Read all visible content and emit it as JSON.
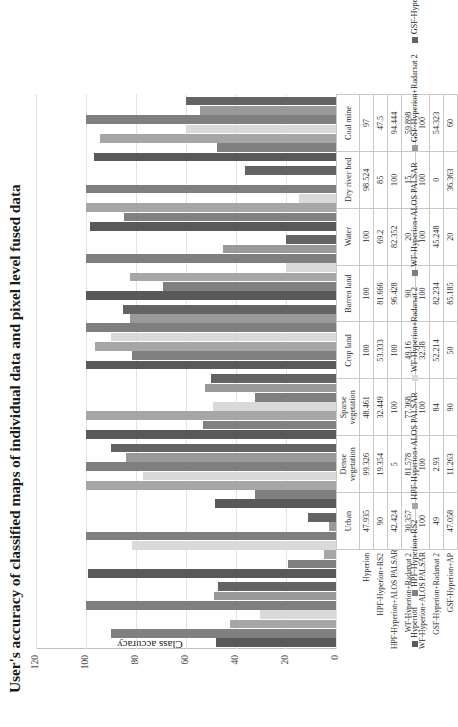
{
  "chart_data": {
    "type": "bar",
    "title": "User's accuracy of classified maps of individual data and pixel level fused data",
    "xlabel": "",
    "ylabel": "Class accuracy",
    "ylim": [
      0,
      120
    ],
    "yticks": [
      120,
      100,
      80,
      60,
      40,
      20,
      0
    ],
    "grid": true,
    "legend_position": "bottom",
    "categories": [
      "Urban",
      "Dense vegetation",
      "Sparse vegetation",
      "Crop land",
      "Barren land",
      "Water",
      "Dry river bed",
      "Coal mine"
    ],
    "series": [
      {
        "name": "Hyperion",
        "color": "#595959",
        "values": [
          47.935,
          99.326,
          48.461,
          100,
          100,
          100,
          98.524,
          97
        ]
      },
      {
        "name": "HPF-Hyperion+RS2",
        "color": "#808080",
        "values": [
          90,
          19.354,
          32.449,
          53.333,
          81.666,
          69.2,
          85,
          47.5
        ]
      },
      {
        "name": "HPF-Hyperion+ALOS PALSAR",
        "color": "#a6a6a6",
        "values": [
          42.424,
          5,
          100,
          100,
          96.428,
          82.352,
          100,
          94.444
        ]
      },
      {
        "name": "WF-Hyperion+Radarsat 2",
        "color": "#d9d9d9",
        "values": [
          30.357,
          81.578,
          77.368,
          49.16,
          90,
          20,
          15,
          59.898
        ]
      },
      {
        "name": "WF-Hyperion+ALOS PALSAR",
        "color": "#7f7f7f",
        "values": [
          100,
          100,
          100,
          32.38,
          100,
          100,
          100,
          100
        ]
      },
      {
        "name": "GSF-Hyperion+Radarsat 2",
        "color": "#999999",
        "values": [
          49,
          2.93,
          84,
          52.214,
          82.234,
          45.248,
          0,
          54.323
        ]
      },
      {
        "name": "GSF-Hyperion+AP",
        "color": "#636363",
        "values": [
          47.058,
          11.263,
          90,
          50,
          85.185,
          20,
          36.363,
          60
        ]
      }
    ]
  },
  "table": {
    "column_headers": [
      "Urban",
      "Dense vegetation",
      "Sparse vegetation",
      "Crop land",
      "Barren land",
      "Water",
      "Dry river bed",
      "Coal mine"
    ],
    "rows": [
      {
        "label": "Hyperion",
        "values": [
          "47.935",
          "99.326",
          "48.461",
          "100",
          "100",
          "100",
          "98.524",
          "97"
        ]
      },
      {
        "label": "HPF-Hyperion+RS2",
        "values": [
          "90",
          "19.354",
          "32.449",
          "53.333",
          "81.666",
          "69.2",
          "85",
          "47.5"
        ]
      },
      {
        "label": "HPF-Hyperion+ALOS PALSAR",
        "values": [
          "42.424",
          "5",
          "100",
          "100",
          "96.428",
          "82.352",
          "100",
          "94.444"
        ]
      },
      {
        "label": "WF-Hyperion+Radarsat 2",
        "values": [
          "30.357",
          "81.578",
          "77.368",
          "49.16",
          "90",
          "20",
          "15",
          "59.898"
        ]
      },
      {
        "label": "WF-Hyperion+ALOS PALSAR",
        "values": [
          "100",
          "100",
          "100",
          "32.38",
          "100",
          "100",
          "100",
          "100"
        ]
      },
      {
        "label": "GSF-Hyperion+Radarsat 2",
        "values": [
          "49",
          "2.93",
          "84",
          "52.214",
          "82.234",
          "45.248",
          "0",
          "54.323"
        ]
      },
      {
        "label": "GSF-Hyperion+AP",
        "values": [
          "47.058",
          "11.263",
          "90",
          "50",
          "85.185",
          "20",
          "36.363",
          "60"
        ]
      }
    ]
  }
}
